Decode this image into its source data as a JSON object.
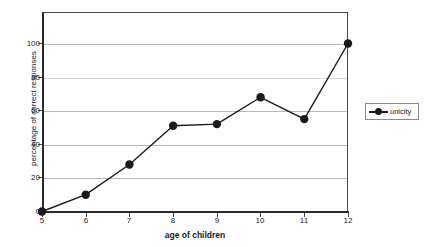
{
  "chart_data": {
    "type": "line",
    "title": "",
    "xlabel": "age of children",
    "ylabel": "percentage of correct responses",
    "x": [
      5,
      6,
      7,
      8,
      9,
      10,
      11,
      12
    ],
    "xticklabels": [
      "5",
      "6",
      "7",
      "8",
      "9",
      "10",
      "11",
      "12"
    ],
    "yticklabels": [
      "0",
      "20",
      "40",
      "60",
      "80",
      "100"
    ],
    "yticks": [
      0,
      20,
      40,
      60,
      80,
      100
    ],
    "xlim": [
      5,
      12
    ],
    "ylim": [
      0,
      119
    ],
    "grid": "horizontal",
    "legend_position": "right",
    "series": [
      {
        "name": "unicity",
        "color": "#1a1a1a",
        "marker": "circle",
        "values": [
          0,
          10,
          28,
          51,
          52,
          68,
          55,
          100
        ]
      }
    ]
  },
  "legend": {
    "entries": [
      {
        "label": "unicity"
      }
    ]
  }
}
